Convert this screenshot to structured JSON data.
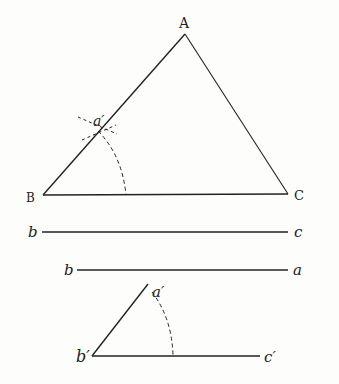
{
  "figure": {
    "triangle": {
      "A": "A",
      "B": "B",
      "C": "C",
      "a_prime": "a′"
    },
    "line1": {
      "left": "b",
      "right": "c"
    },
    "line2": {
      "left": "b",
      "right": "a"
    },
    "copy": {
      "a_prime": "a′",
      "b_prime": "b′",
      "c_prime": "c′"
    },
    "ink_color": "#222222"
  }
}
